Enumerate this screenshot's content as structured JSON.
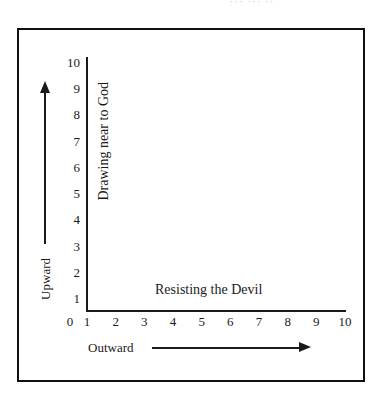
{
  "page": {
    "top_artifact_text": "··· ··· ··"
  },
  "chart_data": {
    "type": "scatter",
    "title": "",
    "subtitle": "",
    "xlabel": "Outward",
    "ylabel": "Upward",
    "x_axis_caption": "Outward",
    "y_axis_caption": "Upward",
    "x_inner_label": "Resisting the Devil",
    "y_inner_label": "Drawing near to God",
    "xlim": [
      0,
      10
    ],
    "ylim": [
      0,
      10
    ],
    "grid": false,
    "legend": null,
    "series": [],
    "values": [],
    "x": [],
    "categories": [],
    "annotations": [
      {
        "text": "Resisting the Devil",
        "axis": "x",
        "placement": "inside-plot-bottom"
      },
      {
        "text": "Drawing near to God",
        "axis": "y",
        "placement": "inside-plot-left",
        "rotation": -90
      },
      {
        "text": "Outward",
        "axis": "x",
        "placement": "below-axis",
        "arrow": "right"
      },
      {
        "text": "Upward",
        "axis": "y",
        "placement": "left-of-axis",
        "arrow": "up"
      }
    ],
    "x_ticks": [
      {
        "label": "0",
        "value": 0
      },
      {
        "label": "1",
        "value": 1
      },
      {
        "label": "2",
        "value": 2
      },
      {
        "label": "3",
        "value": 3
      },
      {
        "label": "4",
        "value": 4
      },
      {
        "label": "5",
        "value": 5
      },
      {
        "label": "6",
        "value": 6
      },
      {
        "label": "7",
        "value": 7
      },
      {
        "label": "8",
        "value": 8
      },
      {
        "label": "9",
        "value": 9
      },
      {
        "label": "10",
        "value": 10
      }
    ],
    "y_ticks": [
      {
        "label": "10",
        "value": 10
      },
      {
        "label": "9",
        "value": 9
      },
      {
        "label": "8",
        "value": 8
      },
      {
        "label": "7",
        "value": 7
      },
      {
        "label": "6",
        "value": 6
      },
      {
        "label": "5",
        "value": 5
      },
      {
        "label": "4",
        "value": 4
      },
      {
        "label": "3",
        "value": 3
      },
      {
        "label": "2",
        "value": 2
      },
      {
        "label": "1",
        "value": 1
      },
      {
        "label": "0",
        "value": 0
      }
    ],
    "colors": {
      "axis": "#1a1a1a",
      "frame": "#101010",
      "text": "#1a1a1a",
      "background": "#ffffff"
    }
  }
}
